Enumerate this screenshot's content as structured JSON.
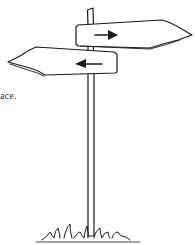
{
  "caption": {
    "text": "ace."
  },
  "illustration": {
    "subject": "signpost",
    "signs": [
      {
        "name": "upper-sign",
        "direction": "right",
        "arrow_glyph": "right-arrow-icon"
      },
      {
        "name": "lower-sign",
        "direction": "left",
        "arrow_glyph": "left-arrow-icon"
      }
    ],
    "ground": "grass",
    "stroke_color": "#1a1a1a",
    "fill_color": "#ffffff"
  }
}
